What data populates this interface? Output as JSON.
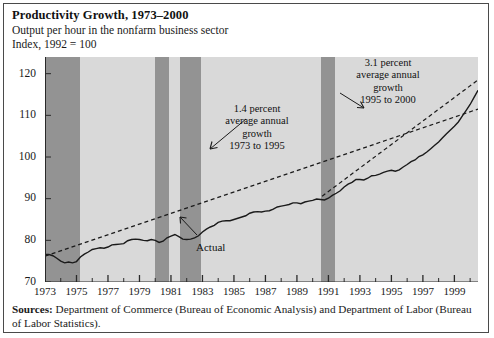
{
  "figure": {
    "title": "Productivity Growth, 1973–2000",
    "subtitle": "Output per hour in the nonfarm business sector",
    "index_note": "Index, 1992 = 100",
    "sources_label": "Sources:",
    "sources_text": " Department of Commerce (Bureau of Economic Analysis) and Department of Labor (Bureau of Labor Statistics)."
  },
  "annotations": {
    "trend1": {
      "line1": "1.4 percent",
      "line2": "average annual",
      "line3": "growth",
      "line4": "1973 to 1995"
    },
    "trend2": {
      "line1": "3.1 percent",
      "line2": "average annual",
      "line3": "growth",
      "line4": "1995 to 2000"
    },
    "actual": "Actual"
  },
  "colors": {
    "plot_background": "#d9d9d9",
    "recession_band": "#939393",
    "data_line": "#1a1a1a",
    "trend_line": "#1a1a1a",
    "frame": "#4a4a4a",
    "text": "#1a1a1a"
  },
  "chart_data": {
    "type": "line",
    "title": "Productivity Growth, 1973–2000",
    "subtitle": "Output per hour in the nonfarm business sector",
    "xlabel": "",
    "ylabel": "Index, 1992 = 100",
    "xlim": [
      1973,
      2000.5
    ],
    "ylim": [
      70,
      124
    ],
    "grid": false,
    "legend": "none",
    "ytick_labels": [
      "70",
      "80",
      "90",
      "100",
      "110",
      "120"
    ],
    "yticks": [
      70,
      80,
      90,
      100,
      110,
      120
    ],
    "xtick_labels": [
      "1973",
      "1975",
      "1977",
      "1979",
      "1981",
      "1983",
      "1985",
      "1987",
      "1989",
      "1991",
      "1993",
      "1995",
      "1997",
      "1999"
    ],
    "xticks": [
      1973,
      1975,
      1977,
      1979,
      1981,
      1983,
      1985,
      1987,
      1989,
      1991,
      1993,
      1995,
      1997,
      1999
    ],
    "xticks_minor": [
      1974,
      1976,
      1978,
      1980,
      1982,
      1984,
      1986,
      1988,
      1990,
      1992,
      1994,
      1996,
      1998,
      2000
    ],
    "series": [
      {
        "name": "Actual",
        "style": "solid",
        "x": [
          1973.0,
          1973.25,
          1973.5,
          1973.75,
          1974.0,
          1974.25,
          1974.5,
          1974.75,
          1975.0,
          1975.25,
          1975.5,
          1975.75,
          1976.0,
          1976.25,
          1976.5,
          1976.75,
          1977.0,
          1977.25,
          1977.5,
          1977.75,
          1978.0,
          1978.25,
          1978.5,
          1978.75,
          1979.0,
          1979.25,
          1979.5,
          1979.75,
          1980.0,
          1980.25,
          1980.5,
          1980.75,
          1981.0,
          1981.25,
          1981.5,
          1981.75,
          1982.0,
          1982.25,
          1982.5,
          1982.75,
          1983.0,
          1983.25,
          1983.5,
          1983.75,
          1984.0,
          1984.25,
          1984.5,
          1984.75,
          1985.0,
          1985.25,
          1985.5,
          1985.75,
          1986.0,
          1986.25,
          1986.5,
          1986.75,
          1987.0,
          1987.25,
          1987.5,
          1987.75,
          1988.0,
          1988.25,
          1988.5,
          1988.75,
          1989.0,
          1989.25,
          1989.5,
          1989.75,
          1990.0,
          1990.25,
          1990.5,
          1990.75,
          1991.0,
          1991.25,
          1991.5,
          1991.75,
          1992.0,
          1992.25,
          1992.5,
          1992.75,
          1993.0,
          1993.25,
          1993.5,
          1993.75,
          1994.0,
          1994.25,
          1994.5,
          1994.75,
          1995.0,
          1995.25,
          1995.5,
          1995.75,
          1996.0,
          1996.25,
          1996.5,
          1996.75,
          1997.0,
          1997.25,
          1997.5,
          1997.75,
          1998.0,
          1998.25,
          1998.5,
          1998.75,
          1999.0,
          1999.25,
          1999.5,
          1999.75,
          2000.0,
          2000.25,
          2000.5
        ],
        "y": [
          76.6,
          76.6,
          76.3,
          75.7,
          75.0,
          74.6,
          74.8,
          74.6,
          74.9,
          76.0,
          76.7,
          77.2,
          77.8,
          78.0,
          78.2,
          78.1,
          78.4,
          78.9,
          79.0,
          79.1,
          79.2,
          79.9,
          80.2,
          80.3,
          80.2,
          80.0,
          79.9,
          80.2,
          80.0,
          79.5,
          79.8,
          80.6,
          81.0,
          81.4,
          80.9,
          80.3,
          80.2,
          80.3,
          80.6,
          81.1,
          82.0,
          82.7,
          83.2,
          83.6,
          84.3,
          84.6,
          84.7,
          84.7,
          85.0,
          85.3,
          85.6,
          85.9,
          86.5,
          86.8,
          86.9,
          86.8,
          87.0,
          87.1,
          87.5,
          88.0,
          88.2,
          88.4,
          88.6,
          89.0,
          89.0,
          88.8,
          89.2,
          89.4,
          89.6,
          89.9,
          89.8,
          89.7,
          90.1,
          90.8,
          91.3,
          91.9,
          92.8,
          93.5,
          93.9,
          94.6,
          94.6,
          94.5,
          94.9,
          95.5,
          95.6,
          95.9,
          96.3,
          96.6,
          96.8,
          96.6,
          96.9,
          97.6,
          98.2,
          98.9,
          99.3,
          100.1,
          100.5,
          101.2,
          102.0,
          102.8,
          103.6,
          104.6,
          105.6,
          106.5,
          107.4,
          108.4,
          109.8,
          111.2,
          112.6,
          114.3,
          116.0
        ]
      },
      {
        "name": "Trend 1973 to 1995 (1.4 percent average annual growth)",
        "style": "dashed",
        "x": [
          1973.0,
          2000.5
        ],
        "y": [
          76.2,
          111.5
        ]
      },
      {
        "name": "Trend 1995 to 2000 (3.1 percent average annual growth)",
        "style": "dashed",
        "x": [
          1990.6,
          2000.5
        ],
        "y": [
          90.6,
          118.5
        ]
      }
    ],
    "recession_bands": [
      {
        "start": 1973.0,
        "end": 1975.2
      },
      {
        "start": 1980.0,
        "end": 1980.9
      },
      {
        "start": 1981.6,
        "end": 1982.9
      },
      {
        "start": 1990.5,
        "end": 1991.4
      }
    ]
  }
}
